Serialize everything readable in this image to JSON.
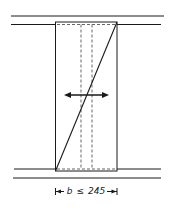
{
  "diagram": {
    "type": "wall-section-schematic",
    "dimension": {
      "symbol": "b",
      "relation": "≤",
      "value": "245"
    },
    "colors": {
      "line": "#1a1a1a",
      "dashed": "#555555",
      "background": "#ffffff"
    }
  }
}
